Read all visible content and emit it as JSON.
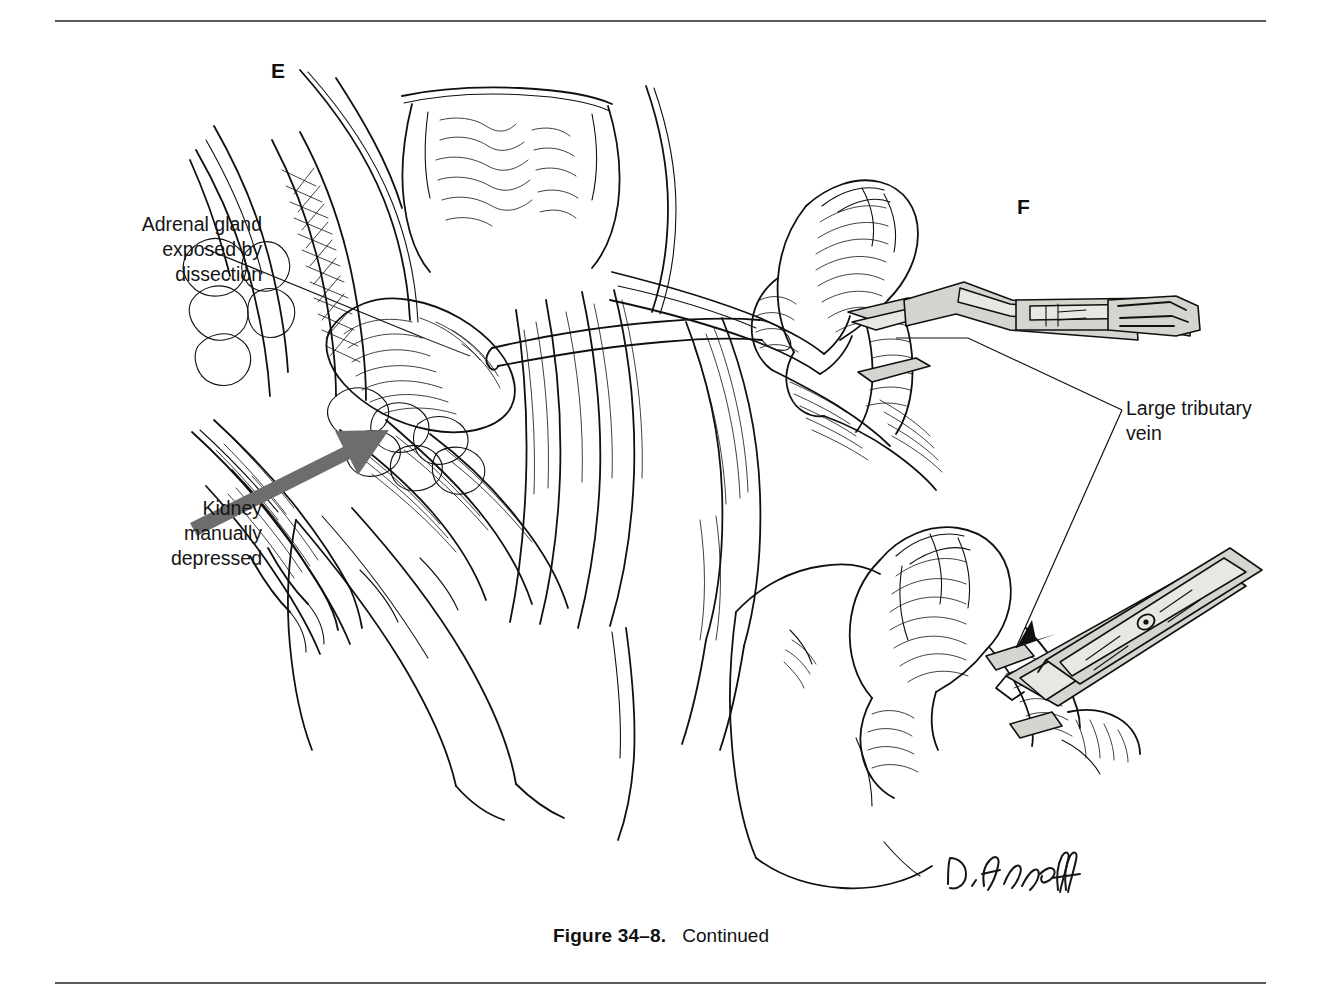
{
  "page": {
    "width": 1322,
    "height": 998,
    "background": "#ffffff",
    "rule_color": "#5a5a5a"
  },
  "figure": {
    "panels": [
      {
        "id": "E",
        "letter": "E",
        "description": "Adrenal gland exposed by dissection with kidney manually depressed"
      },
      {
        "id": "F",
        "letter": "F",
        "description": "Large tributary vein clamped between two hemostats"
      }
    ],
    "annotations": [
      {
        "id": "adrenal-gland",
        "text": "Adrenal gland\nexposed by\ndissection",
        "align": "right",
        "leader": "line"
      },
      {
        "id": "kidney-depressed",
        "text": "Kidney\nmanually\ndepressed",
        "align": "right",
        "leader": "gray-arrow",
        "arrow_color": "#6d6d6d"
      },
      {
        "id": "large-tributary-vein",
        "text": "Large tributary\nvein",
        "align": "left",
        "leader": "two-branch-arrow"
      }
    ],
    "caption": {
      "label": "Figure 34–8.",
      "text": "Continued"
    },
    "signature": {
      "text": "D. Abeloff",
      "style": "handwritten"
    },
    "colors": {
      "ink": "#101010",
      "instrument_metal": "#d6d4cf",
      "instrument_highlight": "#e9e7e2",
      "arrow_gray": "#6d6d6d",
      "rule": "#5a5a5a"
    },
    "medium": "pen-and-ink line drawing"
  }
}
